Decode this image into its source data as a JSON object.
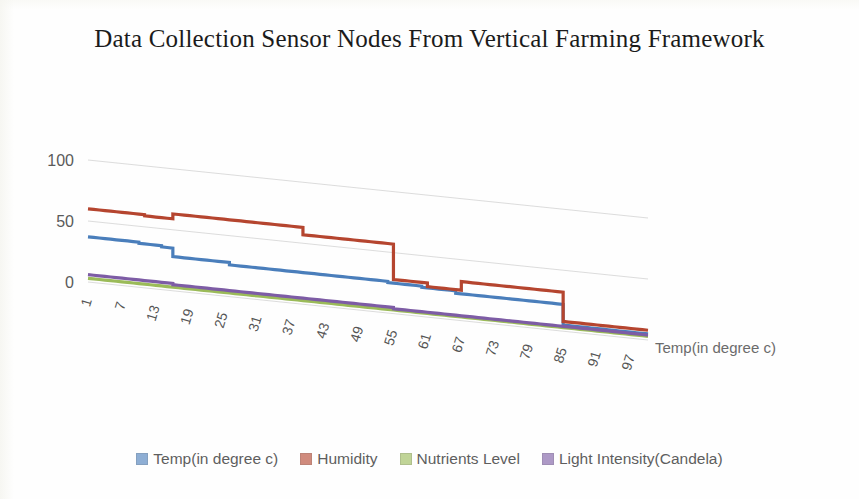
{
  "title": "Data Collection Sensor Nodes From Vertical Farming Framework",
  "axis": {
    "y_ticks": [
      "0",
      "50",
      "100"
    ],
    "y_tick_values": [
      0,
      50,
      100
    ],
    "x_ticks": [
      "1",
      "7",
      "13",
      "19",
      "25",
      "31",
      "37",
      "43",
      "49",
      "55",
      "61",
      "67",
      "73",
      "79",
      "85",
      "91",
      "97"
    ],
    "x_axis_title": "Temp(in degree c)"
  },
  "legend": {
    "items": [
      {
        "label": "Temp(in degree c)",
        "color": "#4A7EBB"
      },
      {
        "label": "Humidity",
        "color": "#B5452F"
      },
      {
        "label": "Nutrients Level",
        "color": "#9BBB59"
      },
      {
        "label": "Light Intensity(Candela)",
        "color": "#7D5CA5"
      }
    ]
  },
  "chart_data": {
    "type": "line",
    "title": "Data Collection Sensor Nodes From Vertical Farming Framework",
    "xlabel": "Temp(in degree c)",
    "ylabel": "",
    "ylim": [
      0,
      100
    ],
    "grid": true,
    "legend_position": "bottom",
    "note": "Skewed (3D-perspective) line chart; all gridlines and series slope downward to the right.",
    "x": [
      1,
      2,
      3,
      4,
      5,
      6,
      7,
      8,
      9,
      10,
      11,
      12,
      13,
      14,
      15,
      16,
      17,
      18,
      19,
      20,
      21,
      22,
      23,
      24,
      25,
      26,
      27,
      28,
      29,
      30,
      31,
      32,
      33,
      34,
      35,
      36,
      37,
      38,
      39,
      40,
      41,
      42,
      43,
      44,
      45,
      46,
      47,
      48,
      49,
      50,
      51,
      52,
      53,
      54,
      55,
      56,
      57,
      58,
      59,
      60,
      61,
      62,
      63,
      64,
      65,
      66,
      67,
      68,
      69,
      70,
      71,
      72,
      73,
      74,
      75,
      76,
      77,
      78,
      79,
      80,
      81,
      82,
      83,
      84,
      85,
      86,
      87,
      88,
      89,
      90,
      91,
      92,
      93,
      94,
      95,
      96,
      97,
      98,
      99,
      100
    ],
    "x_tick_labels": [
      "1",
      "7",
      "13",
      "19",
      "25",
      "31",
      "37",
      "43",
      "49",
      "55",
      "61",
      "67",
      "73",
      "79",
      "85",
      "91",
      "97"
    ],
    "series": [
      {
        "name": "Temp(in degree c)",
        "color": "#4A7EBB",
        "values": [
          37,
          37,
          37,
          37,
          37,
          37,
          37,
          37,
          37,
          36,
          36,
          36,
          36,
          35,
          35,
          28,
          28,
          28,
          28,
          28,
          28,
          28,
          28,
          28,
          28,
          26,
          26,
          26,
          26,
          26,
          26,
          26,
          26,
          26,
          26,
          26,
          26,
          26,
          26,
          26,
          26,
          26,
          26,
          26,
          26,
          26,
          26,
          26,
          26,
          26,
          26,
          26,
          26,
          25,
          25,
          25,
          25,
          25,
          25,
          24,
          24,
          24,
          24,
          24,
          24,
          22,
          22,
          22,
          22,
          22,
          22,
          22,
          22,
          22,
          22,
          22,
          22,
          22,
          22,
          22,
          22,
          22,
          22,
          22,
          5,
          5,
          5,
          5,
          5,
          5,
          5,
          5,
          5,
          5,
          5,
          5,
          5,
          5,
          5,
          5
        ]
      },
      {
        "name": "Humidity",
        "color": "#B5452F",
        "values": [
          60,
          60,
          60,
          60,
          60,
          60,
          60,
          60,
          60,
          60,
          59,
          59,
          59,
          59,
          59,
          63,
          63,
          63,
          63,
          63,
          63,
          63,
          63,
          63,
          63,
          63,
          63,
          63,
          63,
          63,
          63,
          63,
          63,
          63,
          63,
          63,
          63,
          63,
          57,
          57,
          57,
          57,
          57,
          57,
          57,
          57,
          57,
          57,
          57,
          57,
          57,
          57,
          57,
          57,
          28,
          28,
          28,
          28,
          28,
          28,
          25,
          25,
          25,
          25,
          25,
          25,
          32,
          32,
          32,
          32,
          32,
          32,
          32,
          32,
          32,
          32,
          32,
          32,
          32,
          32,
          32,
          32,
          32,
          32,
          8,
          8,
          8,
          8,
          8,
          8,
          8,
          8,
          8,
          8,
          8,
          8,
          8,
          8,
          8,
          8
        ]
      },
      {
        "name": "Nutrients Level",
        "color": "#9BBB59",
        "values": [
          3,
          3,
          3,
          3,
          3,
          3,
          3,
          3,
          3,
          3,
          3,
          3,
          3,
          3,
          3,
          3,
          3,
          3,
          3,
          3,
          3,
          3,
          3,
          3,
          3,
          3,
          3,
          3,
          3,
          3,
          3,
          3,
          3,
          3,
          3,
          3,
          3,
          3,
          3,
          3,
          3,
          3,
          3,
          3,
          3,
          3,
          3,
          3,
          3,
          3,
          3,
          3,
          3,
          3,
          3,
          3,
          3,
          3,
          3,
          3,
          3,
          3,
          3,
          3,
          3,
          3,
          3,
          3,
          3,
          3,
          3,
          3,
          3,
          3,
          3,
          3,
          3,
          3,
          3,
          3,
          3,
          3,
          3,
          3,
          3,
          3,
          3,
          3,
          3,
          3,
          3,
          3,
          3,
          3,
          3,
          3,
          3,
          3,
          3,
          3
        ]
      },
      {
        "name": "Light Intensity(Candela)",
        "color": "#7D5CA5",
        "values": [
          6,
          6,
          6,
          6,
          6,
          6,
          6,
          6,
          6,
          6,
          6,
          6,
          6,
          6,
          6,
          5,
          5,
          5,
          5,
          5,
          5,
          5,
          5,
          5,
          5,
          5,
          5,
          5,
          5,
          5,
          5,
          5,
          5,
          5,
          5,
          5,
          5,
          5,
          5,
          5,
          5,
          5,
          5,
          5,
          5,
          5,
          5,
          5,
          5,
          5,
          5,
          5,
          5,
          5,
          4,
          4,
          4,
          4,
          4,
          4,
          4,
          4,
          4,
          4,
          4,
          4,
          4,
          4,
          4,
          4,
          4,
          4,
          4,
          4,
          4,
          4,
          4,
          4,
          4,
          4,
          4,
          4,
          4,
          4,
          4,
          4,
          4,
          4,
          4,
          4,
          4,
          4,
          4,
          4,
          4,
          4,
          4,
          4,
          4,
          4
        ]
      }
    ]
  }
}
